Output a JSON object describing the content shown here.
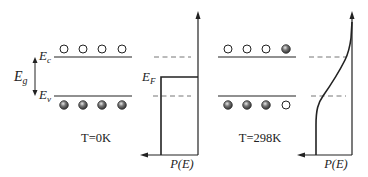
{
  "figure": {
    "left_panel": {
      "conduction_band_label": "E",
      "conduction_band_sub": "c",
      "valence_band_label": "E",
      "valence_band_sub": "v",
      "gap_label": "E",
      "gap_sub": "g",
      "temperature_label": "T=0K",
      "electrons_in_conduction": [
        false,
        false,
        false,
        false
      ],
      "electrons_in_valence": [
        true,
        true,
        true,
        true
      ]
    },
    "left_plot": {
      "fermi_label": "E",
      "fermi_sub": "F",
      "x_axis_label": "P(E)",
      "shape": "step"
    },
    "right_panel": {
      "temperature_label": "T=298K",
      "electrons_in_conduction": [
        false,
        false,
        false,
        true
      ],
      "electrons_in_valence": [
        true,
        true,
        true,
        false
      ]
    },
    "right_plot": {
      "x_axis_label": "P(E)",
      "shape": "smooth-fermi-dirac"
    },
    "colors": {
      "line": "#222222",
      "dashed": "#777777",
      "filled_circle": "#555555"
    }
  }
}
